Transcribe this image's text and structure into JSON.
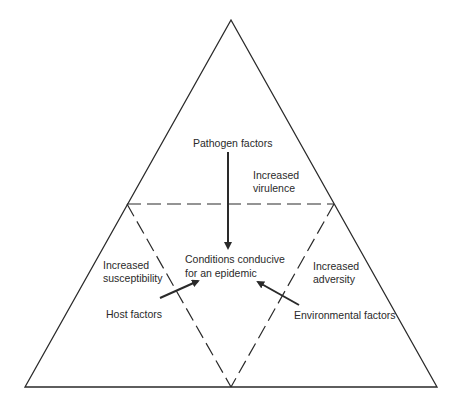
{
  "diagram": {
    "type": "disease-triangle",
    "center_label_line1": "Conditions conducive",
    "center_label_line2": "for an epidemic",
    "top": {
      "factor_label": "Pathogen factors",
      "effect_line1": "Increased",
      "effect_line2": "virulence"
    },
    "left": {
      "factor_label": "Host factors",
      "effect_line1": "Increased",
      "effect_line2": "susceptibility"
    },
    "right": {
      "factor_label": "Environmental factors",
      "effect_line1": "Increased",
      "effect_line2": "adversity"
    },
    "colors": {
      "line": "#2a2a2a",
      "background": "#ffffff"
    }
  }
}
